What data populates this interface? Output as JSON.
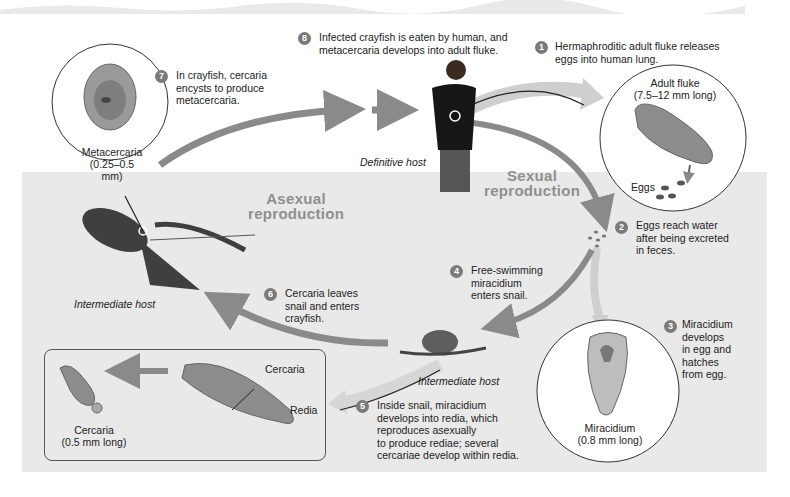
{
  "diagram": {
    "regions": {
      "asexual": "Asexual\nreproduction",
      "sexual": "Sexual\nreproduction"
    },
    "hosts": {
      "definitive": "Definitive host",
      "intermediate_crayfish": "Intermediate host",
      "intermediate_snail": "Intermediate host"
    },
    "stages": {
      "metacercaria": {
        "name": "Metacercaria",
        "size": "(0.25–0.5 mm)"
      },
      "adult_fluke": {
        "name": "Adult fluke",
        "size": "(7.5–12 mm long)"
      },
      "eggs": {
        "name": "Eggs"
      },
      "miracidium": {
        "name": "Miracidium",
        "size": "(0.8 mm long)"
      },
      "cercaria": {
        "name": "Cercaria",
        "size": "(0.5 mm long)"
      },
      "cercaria_inside": {
        "name": "Cercaria"
      },
      "redia": {
        "name": "Redia"
      }
    },
    "steps": [
      {
        "num": "1",
        "text": "Hermaphroditic adult fluke releases eggs into human lung."
      },
      {
        "num": "2",
        "text": "Eggs reach water after being excreted in feces."
      },
      {
        "num": "3",
        "text": "Miracidium develops in egg and hatches from egg."
      },
      {
        "num": "4",
        "text": "Free-swimming miracidium enters snail."
      },
      {
        "num": "5",
        "text": "Inside snail, miracidium develops into redia, which reproduces asexually to produce rediae; several cercariae develop within redia."
      },
      {
        "num": "6",
        "text": "Cercaria leaves snail and enters crayfish."
      },
      {
        "num": "7",
        "text": "In crayfish, cercaria encysts to produce metacercaria."
      },
      {
        "num": "8",
        "text": "Infected crayfish is eaten by human, and metacercaria develops into adult fluke."
      }
    ],
    "step_lines": {
      "s1": [
        "Hermaphroditic adult fluke releases",
        "eggs into human lung."
      ],
      "s2": [
        "Eggs reach water",
        "after being excreted",
        "in feces."
      ],
      "s3": [
        "Miracidium",
        "develops",
        "in egg and",
        "hatches",
        "from egg."
      ],
      "s4": [
        "Free-swimming",
        "miracidium",
        "enters snail."
      ],
      "s5": [
        "Inside snail, miracidium",
        "develops into redia, which",
        "reproduces asexually",
        "to produce rediae; several",
        "cercariae develop within redia."
      ],
      "s6": [
        "Cercaria leaves",
        "snail and enters",
        "crayfish."
      ],
      "s7": [
        "In crayfish, cercaria",
        "encysts to produce",
        "metacercaria."
      ],
      "s8": [
        "Infected crayfish is eaten by human, and",
        "metacercaria develops into adult fluke."
      ]
    },
    "colors": {
      "arrow": "#8a8a8a",
      "water": "#e9e9e9",
      "badge": "#7a7a7a",
      "region_text": "#8f8f8f"
    }
  }
}
